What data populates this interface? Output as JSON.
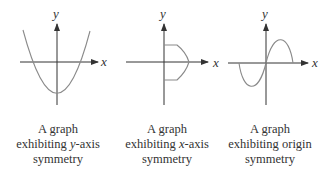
{
  "figures": [
    {
      "id": "y-axis-symmetry",
      "x_label": "x",
      "y_label": "y",
      "caption_line1": "A graph",
      "caption_line2_pre": "exhibiting ",
      "caption_line2_var": "y",
      "caption_line2_post": "-axis",
      "caption_line3": "symmetry"
    },
    {
      "id": "x-axis-symmetry",
      "x_label": "x",
      "y_label": "y",
      "caption_line1": "A graph",
      "caption_line2_pre": "exhibiting ",
      "caption_line2_var": "x",
      "caption_line2_post": "-axis",
      "caption_line3": "symmetry"
    },
    {
      "id": "origin-symmetry",
      "x_label": "x",
      "y_label": "y",
      "caption_line1": "A graph",
      "caption_line2_pre": "exhibiting origin",
      "caption_line2_var": "",
      "caption_line2_post": "",
      "caption_line3": "symmetry"
    }
  ],
  "colors": {
    "axis": "#333333",
    "curve": "#8a8a8a",
    "text": "#333333"
  }
}
